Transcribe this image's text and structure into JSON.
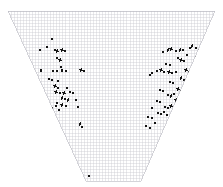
{
  "figure": {
    "title": "",
    "background_color": "#ffffff",
    "width": 223,
    "height": 187
  },
  "domain_outline": {
    "name": "trapezoidal-mesh-domain",
    "shape": "trapezoid",
    "description": "Wide flat top edge with two inward-sloping sides converging to a narrow flat bottom edge",
    "fill_color": "#ffffff",
    "vertices": [
      [
        8,
        11
      ],
      [
        215,
        11
      ],
      [
        141,
        181
      ],
      [
        86,
        181
      ]
    ],
    "top_edge_y": 11,
    "bottom_edge_y": 181,
    "top_left_x": 8,
    "top_right_x": 215,
    "bottom_left_x": 86,
    "bottom_right_x": 141
  },
  "grid": {
    "name": "structured-quad-mesh",
    "line_color": "#c9c9cf",
    "line_width": 0.4,
    "cell_size_px": 3.05,
    "columns": 68,
    "rows": 56,
    "visible": true
  },
  "chart_data": {
    "type": "scatter",
    "title": "",
    "subtitle": "",
    "xlabel": "",
    "ylabel": "",
    "xlim": [
      0,
      223
    ],
    "ylim": [
      187,
      0
    ],
    "grid": true,
    "legend": null,
    "legend_position": "none",
    "marker": {
      "color": "#141414",
      "shape": "rect",
      "default_width": 2.2,
      "default_height": 2.6
    },
    "annotations": [],
    "clusters": [
      {
        "name": "left-cluster",
        "label": "",
        "point_count": 41,
        "centroid": [
          76,
          86
        ]
      },
      {
        "name": "right-cluster",
        "label": "",
        "point_count": 78,
        "centroid": [
          168,
          76
        ]
      },
      {
        "name": "isolated-bottom-point",
        "label": "",
        "point_count": 1,
        "centroid": [
          89,
          176
        ]
      }
    ],
    "points": [
      [
        47,
        47,
        2.0,
        2.4,
        62
      ],
      [
        40,
        50,
        2.2,
        2.6,
        0
      ],
      [
        52,
        39,
        1.6,
        1.8,
        0
      ],
      [
        55,
        50,
        1.8,
        2.0,
        55
      ],
      [
        57,
        51,
        2.4,
        2.6,
        60
      ],
      [
        62,
        50,
        2.6,
        2.8,
        58
      ],
      [
        65,
        51,
        2.2,
        2.4,
        0
      ],
      [
        57,
        58,
        2.0,
        2.2,
        50
      ],
      [
        60,
        60,
        2.4,
        2.8,
        62
      ],
      [
        61,
        67,
        1.6,
        1.8,
        0
      ],
      [
        41,
        70,
        2.0,
        3.0,
        0
      ],
      [
        53,
        71,
        1.6,
        1.8,
        0
      ],
      [
        57,
        71,
        1.8,
        2.0,
        0
      ],
      [
        62,
        70,
        2.2,
        3.0,
        0
      ],
      [
        66,
        71,
        1.6,
        1.8,
        0
      ],
      [
        81,
        70,
        2.6,
        2.6,
        60
      ],
      [
        84,
        71,
        2.0,
        2.2,
        0
      ],
      [
        49,
        79,
        1.8,
        2.0,
        0
      ],
      [
        52,
        80,
        2.2,
        2.4,
        55
      ],
      [
        58,
        81,
        1.6,
        1.8,
        0
      ],
      [
        55,
        86,
        2.4,
        2.8,
        62
      ],
      [
        58,
        88,
        1.8,
        2.0,
        0
      ],
      [
        67,
        88,
        1.6,
        1.8,
        0
      ],
      [
        56,
        92,
        2.6,
        2.8,
        58
      ],
      [
        60,
        93,
        2.2,
        2.4,
        0
      ],
      [
        64,
        93,
        2.4,
        2.6,
        60
      ],
      [
        70,
        92,
        2.2,
        2.6,
        0
      ],
      [
        73,
        93,
        1.8,
        2.0,
        0
      ],
      [
        62,
        98,
        2.4,
        2.8,
        55
      ],
      [
        65,
        99,
        2.0,
        2.2,
        0
      ],
      [
        68,
        100,
        2.2,
        2.4,
        60
      ],
      [
        57,
        103,
        2.0,
        2.8,
        0
      ],
      [
        56,
        106,
        2.2,
        2.4,
        0
      ],
      [
        62,
        105,
        2.4,
        2.6,
        58
      ],
      [
        66,
        106,
        2.0,
        2.2,
        0
      ],
      [
        76,
        100,
        1.8,
        2.0,
        0
      ],
      [
        78,
        107,
        2.0,
        2.2,
        0
      ],
      [
        52,
        108,
        1.8,
        2.6,
        0
      ],
      [
        59,
        110,
        1.6,
        1.8,
        0
      ],
      [
        80,
        124,
        2.2,
        2.8,
        55
      ],
      [
        82,
        127,
        1.6,
        1.8,
        0
      ],
      [
        89,
        176,
        2.8,
        2.8,
        0
      ],
      [
        214,
        38,
        1.8,
        2.0,
        0
      ],
      [
        163,
        52,
        1.6,
        1.8,
        0
      ],
      [
        168,
        50,
        2.4,
        2.8,
        58
      ],
      [
        171,
        49,
        2.6,
        2.8,
        60
      ],
      [
        176,
        51,
        1.8,
        2.0,
        0
      ],
      [
        180,
        50,
        2.4,
        2.6,
        55
      ],
      [
        183,
        50,
        2.2,
        2.4,
        0
      ],
      [
        190,
        48,
        2.0,
        2.4,
        62
      ],
      [
        192,
        46,
        2.2,
        2.6,
        60
      ],
      [
        196,
        48,
        2.0,
        2.2,
        0
      ],
      [
        199,
        50,
        1.6,
        1.8,
        0
      ],
      [
        203,
        47,
        2.4,
        2.8,
        58
      ],
      [
        205,
        52,
        1.6,
        1.8,
        0
      ],
      [
        187,
        55,
        1.8,
        2.0,
        0
      ],
      [
        196,
        57,
        1.6,
        1.8,
        0
      ],
      [
        178,
        58,
        1.8,
        2.0,
        0
      ],
      [
        181,
        60,
        2.4,
        2.8,
        60
      ],
      [
        184,
        61,
        2.0,
        2.2,
        0
      ],
      [
        198,
        62,
        1.8,
        2.0,
        0
      ],
      [
        201,
        61,
        2.2,
        2.6,
        55
      ],
      [
        205,
        63,
        1.6,
        1.8,
        0
      ],
      [
        166,
        64,
        1.8,
        2.0,
        0
      ],
      [
        170,
        65,
        2.0,
        2.4,
        58
      ],
      [
        152,
        73,
        2.2,
        2.6,
        0
      ],
      [
        157,
        71,
        1.8,
        2.0,
        0
      ],
      [
        161,
        70,
        2.4,
        2.8,
        60
      ],
      [
        164,
        72,
        2.0,
        2.2,
        0
      ],
      [
        169,
        72,
        2.6,
        2.8,
        55
      ],
      [
        172,
        73,
        2.4,
        2.6,
        0
      ],
      [
        176,
        72,
        2.2,
        2.4,
        58
      ],
      [
        186,
        70,
        2.6,
        3.0,
        62
      ],
      [
        189,
        72,
        2.2,
        2.4,
        0
      ],
      [
        192,
        70,
        2.4,
        2.8,
        60
      ],
      [
        197,
        71,
        2.0,
        2.4,
        0
      ],
      [
        201,
        70,
        2.6,
        3.0,
        58
      ],
      [
        204,
        73,
        1.8,
        2.0,
        0
      ],
      [
        150,
        75,
        1.8,
        2.2,
        0
      ],
      [
        181,
        78,
        2.2,
        2.6,
        60
      ],
      [
        184,
        80,
        2.0,
        2.2,
        0
      ],
      [
        192,
        79,
        2.4,
        2.8,
        55
      ],
      [
        195,
        81,
        1.8,
        2.0,
        0
      ],
      [
        170,
        82,
        2.2,
        2.4,
        0
      ],
      [
        173,
        83,
        2.0,
        2.2,
        58
      ],
      [
        198,
        85,
        2.0,
        2.4,
        0
      ],
      [
        160,
        90,
        2.6,
        2.6,
        0
      ],
      [
        163,
        91,
        2.2,
        2.4,
        0
      ],
      [
        178,
        89,
        2.4,
        2.8,
        60
      ],
      [
        181,
        91,
        2.2,
        2.4,
        0
      ],
      [
        184,
        92,
        2.0,
        2.2,
        55
      ],
      [
        188,
        90,
        2.4,
        2.8,
        58
      ],
      [
        196,
        91,
        1.8,
        2.0,
        0
      ],
      [
        168,
        95,
        2.4,
        2.6,
        0
      ],
      [
        171,
        96,
        2.2,
        2.4,
        60
      ],
      [
        174,
        94,
        2.0,
        2.2,
        0
      ],
      [
        186,
        96,
        2.6,
        3.0,
        62
      ],
      [
        189,
        98,
        2.2,
        2.4,
        0
      ],
      [
        192,
        97,
        2.0,
        2.4,
        58
      ],
      [
        157,
        101,
        2.2,
        2.6,
        0
      ],
      [
        160,
        102,
        1.8,
        2.0,
        0
      ],
      [
        176,
        100,
        2.4,
        2.8,
        60
      ],
      [
        179,
        102,
        2.2,
        2.4,
        0
      ],
      [
        182,
        103,
        2.0,
        2.2,
        55
      ],
      [
        186,
        104,
        2.4,
        2.8,
        58
      ],
      [
        165,
        107,
        2.2,
        2.6,
        0
      ],
      [
        168,
        108,
        2.0,
        2.2,
        0
      ],
      [
        171,
        106,
        2.4,
        2.6,
        60
      ],
      [
        152,
        108,
        2.0,
        2.4,
        0
      ],
      [
        174,
        110,
        1.8,
        2.0,
        0
      ],
      [
        177,
        111,
        2.2,
        2.6,
        55
      ],
      [
        158,
        113,
        2.4,
        2.8,
        0
      ],
      [
        161,
        114,
        2.0,
        2.2,
        0
      ],
      [
        164,
        112,
        2.2,
        2.4,
        58
      ],
      [
        167,
        115,
        1.8,
        2.0,
        0
      ],
      [
        148,
        117,
        2.0,
        2.4,
        0
      ],
      [
        152,
        118,
        1.8,
        2.0,
        0
      ],
      [
        170,
        118,
        2.2,
        2.6,
        60
      ],
      [
        173,
        120,
        1.6,
        1.8,
        0
      ],
      [
        155,
        123,
        1.8,
        2.0,
        0
      ],
      [
        176,
        124,
        1.6,
        1.8,
        0
      ],
      [
        146,
        126,
        1.6,
        1.8,
        0
      ],
      [
        150,
        128,
        1.8,
        2.0,
        0
      ]
    ]
  }
}
